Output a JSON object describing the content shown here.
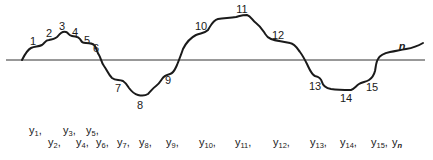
{
  "diagram": {
    "baseline": {
      "x1": 6,
      "x2": 425,
      "y": 60
    },
    "curve_color": "#1a1a1a",
    "point_labels": [
      {
        "text": "1",
        "x": 33,
        "y": 45
      },
      {
        "text": "2",
        "x": 49,
        "y": 37
      },
      {
        "text": "3",
        "x": 62,
        "y": 30
      },
      {
        "text": "4",
        "x": 75,
        "y": 36
      },
      {
        "text": "5",
        "x": 87,
        "y": 44
      },
      {
        "text": "6",
        "x": 96,
        "y": 52
      },
      {
        "text": "7",
        "x": 118,
        "y": 92
      },
      {
        "text": "8",
        "x": 140,
        "y": 109
      },
      {
        "text": "9",
        "x": 168,
        "y": 84
      },
      {
        "text": "10",
        "x": 201,
        "y": 30
      },
      {
        "text": "11",
        "x": 242,
        "y": 13
      },
      {
        "text": "12",
        "x": 278,
        "y": 39
      },
      {
        "text": "13",
        "x": 315,
        "y": 90
      },
      {
        "text": "14",
        "x": 346,
        "y": 102
      },
      {
        "text": "15",
        "x": 372,
        "y": 91
      },
      {
        "text": "n",
        "x": 402,
        "y": 50,
        "italic": true
      }
    ],
    "y_labels": [
      {
        "base": "y",
        "sub": "1",
        "suffix": ",",
        "x": 29,
        "y": 134
      },
      {
        "base": "y",
        "sub": "2",
        "suffix": ",",
        "x": 48,
        "y": 146
      },
      {
        "base": "y",
        "sub": "3",
        "suffix": ",",
        "x": 63,
        "y": 134
      },
      {
        "base": "y",
        "sub": "4",
        "suffix": ",",
        "x": 76,
        "y": 146
      },
      {
        "base": "y",
        "sub": "5",
        "suffix": ",",
        "x": 86,
        "y": 134
      },
      {
        "base": "y",
        "sub": "6",
        "suffix": ",",
        "x": 96,
        "y": 146
      },
      {
        "base": "y",
        "sub": "7",
        "suffix": ",",
        "x": 117,
        "y": 146
      },
      {
        "base": "y",
        "sub": "8",
        "suffix": ",",
        "x": 139,
        "y": 146
      },
      {
        "base": "y",
        "sub": "9",
        "suffix": ",",
        "x": 166,
        "y": 146
      },
      {
        "base": "y",
        "sub": "10",
        "suffix": ",",
        "x": 199,
        "y": 146
      },
      {
        "base": "y",
        "sub": "11",
        "suffix": ",",
        "x": 235,
        "y": 146
      },
      {
        "base": "y",
        "sub": "12",
        "suffix": ",",
        "x": 273,
        "y": 146
      },
      {
        "base": "y",
        "sub": "13",
        "suffix": ",",
        "x": 310,
        "y": 146
      },
      {
        "base": "y",
        "sub": "14",
        "suffix": ",",
        "x": 340,
        "y": 146
      },
      {
        "base": "y",
        "sub": "15",
        "suffix": ",",
        "x": 371,
        "y": 146
      },
      {
        "base": "y",
        "sub": "n",
        "suffix": "",
        "x": 392,
        "y": 146,
        "italic_sub": true
      }
    ]
  }
}
